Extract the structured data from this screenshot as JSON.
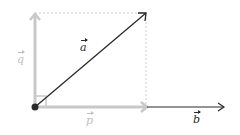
{
  "diagram": {
    "labels": {
      "a": "a",
      "b": "b",
      "p": "p",
      "q": "q"
    },
    "colors": {
      "dark": "#2a2a2a",
      "light": "#c8c8c8",
      "dashed": "#cfcfcf",
      "label_light": "#c0c0c0"
    }
  }
}
